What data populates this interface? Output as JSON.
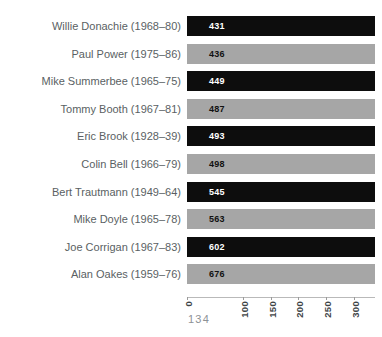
{
  "page": {
    "page_number": "134"
  },
  "colors": {
    "bar_dark": "#0d0d0d",
    "bar_light": "#a6a6a6",
    "label_text": "#5a5f63",
    "tick_text": "#3f4548",
    "value_on_dark": "#ffffff",
    "value_on_light": "#111111",
    "page_number_text": "#8d9296",
    "background": "#ffffff"
  },
  "chart_data": {
    "type": "bar",
    "orientation": "horizontal",
    "title": "",
    "subtitle": "",
    "xlabel": "",
    "ylabel": "",
    "grid": false,
    "legend": null,
    "xlim": [
      0,
      300
    ],
    "xticks": [
      0,
      100,
      150,
      200,
      250,
      300
    ],
    "xtick_labels": [
      "0",
      "100",
      "150",
      "200",
      "250",
      "300"
    ],
    "note": "Bars are clipped at the right edge of the plot; data values exceed the drawn axis range.",
    "categories": [
      "Willie Donachie (1968–80)",
      "Paul Power (1975–86)",
      "Mike Summerbee (1965–75)",
      "Tommy Booth (1967–81)",
      "Eric Brook (1928–39)",
      "Colin Bell (1966–79)",
      "Bert Trautmann (1949–64)",
      "Mike Doyle (1965–78)",
      "Joe Corrigan (1967–83)",
      "Alan Oakes (1959–76)"
    ],
    "values": [
      431,
      436,
      449,
      487,
      493,
      498,
      545,
      563,
      602,
      676
    ],
    "bars": [
      {
        "label": "Willie Donachie (1968–80)",
        "value": 431,
        "value_text": "431",
        "color": "dark"
      },
      {
        "label": "Paul Power (1975–86)",
        "value": 436,
        "value_text": "436",
        "color": "light"
      },
      {
        "label": "Mike Summerbee (1965–75)",
        "value": 449,
        "value_text": "449",
        "color": "dark"
      },
      {
        "label": "Tommy Booth (1967–81)",
        "value": 487,
        "value_text": "487",
        "color": "light"
      },
      {
        "label": "Eric Brook (1928–39)",
        "value": 493,
        "value_text": "493",
        "color": "dark"
      },
      {
        "label": "Colin Bell (1966–79)",
        "value": 498,
        "value_text": "498",
        "color": "light"
      },
      {
        "label": "Bert Trautmann (1949–64)",
        "value": 545,
        "value_text": "545",
        "color": "dark"
      },
      {
        "label": "Mike Doyle (1965–78)",
        "value": 563,
        "value_text": "563",
        "color": "light"
      },
      {
        "label": "Joe Corrigan (1967–83)",
        "value": 602,
        "value_text": "602",
        "color": "dark"
      },
      {
        "label": "Alan Oakes (1959–76)",
        "value": 676,
        "value_text": "676",
        "color": "light"
      }
    ]
  }
}
